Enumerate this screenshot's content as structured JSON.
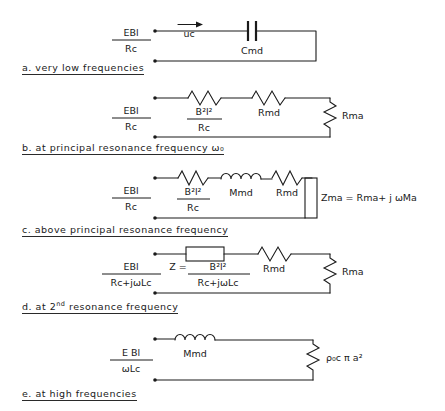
{
  "figure": {
    "title_present": false,
    "ink_color": "#1a1a1a",
    "background": "#ffffff"
  },
  "blocks": [
    {
      "id": "a",
      "caption": "a.  very low frequencies",
      "caption_letter": "a.",
      "caption_text": "very low frequencies",
      "source": {
        "name": "source-emf-a",
        "numerator": "EBl",
        "denominator": "Rc"
      },
      "current_arrow_label": "uc",
      "components": [
        {
          "type": "capacitor",
          "name": "capacitor-cmd",
          "label": "Cmd"
        }
      ],
      "load": null
    },
    {
      "id": "b",
      "caption": "b. at principal resonance frequency  ω₀",
      "caption_letter": "b.",
      "caption_text": "at principal resonance frequency",
      "caption_symbol": "ω₀",
      "source": {
        "name": "source-emf-b",
        "numerator": "EBl",
        "denominator": "Rc"
      },
      "current_arrow_label": null,
      "components": [
        {
          "type": "resistor",
          "name": "resistor-b2l2-over-rc",
          "label_numerator": "B²l²",
          "label_denominator": "Rc",
          "fraction": true
        },
        {
          "type": "resistor",
          "name": "resistor-rmd",
          "label": "Rmd"
        }
      ],
      "load": {
        "type": "resistor-vertical",
        "name": "load-rma",
        "label": "Rma"
      }
    },
    {
      "id": "c",
      "caption": "c. above principal resonance frequency",
      "caption_letter": "c.",
      "caption_text": "above principal resonance frequency",
      "source": {
        "name": "source-emf-c",
        "numerator": "EBl",
        "denominator": "Rc"
      },
      "current_arrow_label": null,
      "components": [
        {
          "type": "resistor",
          "name": "resistor-b2l2-over-rc",
          "label_numerator": "B²l²",
          "label_denominator": "Rc",
          "fraction": true
        },
        {
          "type": "inductor",
          "name": "inductor-mmd",
          "label": "Mmd"
        },
        {
          "type": "resistor",
          "name": "resistor-rmd",
          "label": "Rmd"
        }
      ],
      "load": {
        "type": "box-vertical",
        "name": "load-zma",
        "label": "Zma = Rma+ j ωMa"
      }
    },
    {
      "id": "d",
      "caption": "d. at 2nd  resonance frequency",
      "caption_letter": "d.",
      "caption_text_before": "at 2",
      "caption_superscript": "nd",
      "caption_text_after": "resonance frequency",
      "source": {
        "name": "source-emf-d",
        "numerator": "EBl",
        "denominator": "Rc+jωLc"
      },
      "current_arrow_label": null,
      "components": [
        {
          "type": "box",
          "name": "impedance-z-box",
          "label_prefix": "Z =",
          "label_numerator": "B²l²",
          "label_denominator": "Rc+jωLc",
          "fraction": true
        },
        {
          "type": "resistor",
          "name": "resistor-rmd",
          "label": "Rmd"
        }
      ],
      "load": {
        "type": "resistor-vertical",
        "name": "load-rma",
        "label": "Rma"
      }
    },
    {
      "id": "e",
      "caption": "e.   at high frequencies",
      "caption_letter": "e.",
      "caption_text": "at high frequencies",
      "source": {
        "name": "source-emf-e",
        "numerator": "E Bl",
        "denominator": "ωLc"
      },
      "current_arrow_label": null,
      "components": [
        {
          "type": "inductor",
          "name": "inductor-mmd",
          "label": "Mmd"
        }
      ],
      "load": {
        "type": "resistor-vertical",
        "name": "load-acoustic-radiation",
        "label": "ρ₀c π a²"
      }
    }
  ]
}
